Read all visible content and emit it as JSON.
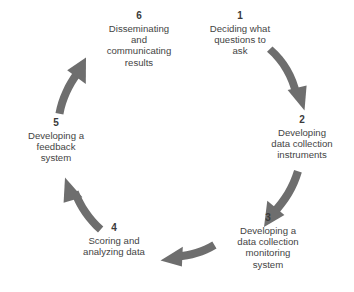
{
  "diagram": {
    "type": "cyclical-process",
    "title": "",
    "direction": "clockwise",
    "step_count": 6,
    "arrow_count": 5,
    "colors": {
      "arrow": "#6e6e6e",
      "arrow_dark": "#636363",
      "text": "#444444",
      "number": "#3a3a3a",
      "background": "#ffffff"
    },
    "steps": [
      {
        "number": "1",
        "label": "Deciding what\nquestions to\nask"
      },
      {
        "number": "2",
        "label": "Developing\ndata collection\ninstruments"
      },
      {
        "number": "3",
        "label": "Developing a\ndata collection\nmonitoring\nsystem"
      },
      {
        "number": "4",
        "label": "Scoring and\nanalyzing data"
      },
      {
        "number": "5",
        "label": "Developing a\nfeedback\nsystem"
      },
      {
        "number": "6",
        "label": "Disseminating\nand\ncommunicating\nresults"
      }
    ],
    "arrows": [
      {
        "from": "1",
        "to": "2",
        "name": "arrow-1-to-2"
      },
      {
        "from": "2",
        "to": "3",
        "name": "arrow-2-to-3"
      },
      {
        "from": "3",
        "to": "4",
        "name": "arrow-3-to-4"
      },
      {
        "from": "4",
        "to": "5",
        "name": "arrow-4-to-5"
      },
      {
        "from": "5",
        "to": "6",
        "name": "arrow-5-to-6"
      }
    ]
  }
}
